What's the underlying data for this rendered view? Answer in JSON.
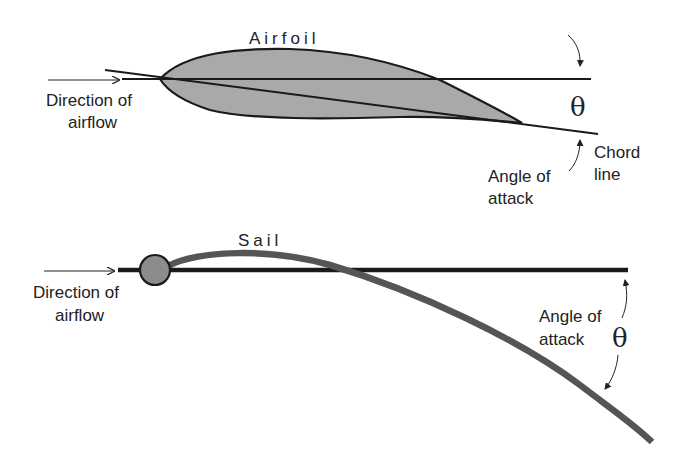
{
  "airfoil_panel": {
    "title": "Airfoil",
    "direction_label_line1": "Direction of",
    "direction_label_line2": "airflow",
    "theta_symbol": "θ",
    "chord_label_line1": "Chord",
    "chord_label_line2": "line",
    "angle_label_line1": "Angle of",
    "angle_label_line2": "attack"
  },
  "sail_panel": {
    "title": "Sail",
    "direction_label_line1": "Direction of",
    "direction_label_line2": "airflow",
    "angle_label_line1": "Angle of",
    "angle_label_line2": "attack",
    "theta_symbol": "θ"
  },
  "colors": {
    "line": "#1a1a1a",
    "airfoil_fill": "#a8a8a8",
    "sail_stroke": "#5a5a5a",
    "mast_fill": "#8a8a8a",
    "text": "#222222"
  }
}
